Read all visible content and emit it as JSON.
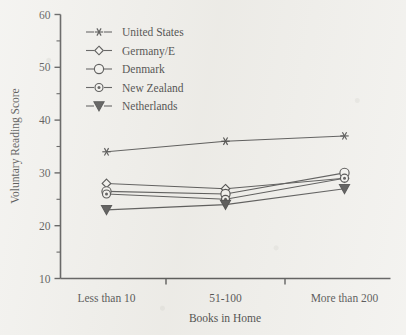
{
  "chart_data": {
    "type": "line",
    "title": "",
    "xlabel": "Books in Home",
    "ylabel": "Voluntary Reading Score",
    "categories": [
      "Less than 10",
      "51-100",
      "More than 200"
    ],
    "ylim": [
      10,
      60
    ],
    "y_ticks": [
      10,
      20,
      30,
      40,
      50,
      60
    ],
    "y_minor_ticks": [
      15,
      25,
      35,
      45,
      55
    ],
    "grid": false,
    "legend_position": "top-left inside plot",
    "series": [
      {
        "name": "United States",
        "marker": "asterisk",
        "values": [
          34,
          36,
          37
        ]
      },
      {
        "name": "Germany/E",
        "marker": "open-diamond",
        "values": [
          28,
          27,
          29
        ]
      },
      {
        "name": "Denmark",
        "marker": "open-circle",
        "values": [
          26.5,
          26,
          30
        ]
      },
      {
        "name": "New Zealand",
        "marker": "dotted-circle",
        "values": [
          26,
          25,
          29
        ]
      },
      {
        "name": "Netherlands",
        "marker": "filled-triangle-down",
        "values": [
          23,
          24,
          27
        ]
      }
    ]
  },
  "axis": {
    "y_tick_labels": [
      "60",
      "50",
      "40",
      "30",
      "20",
      "10"
    ],
    "x_tick_labels": [
      "Less than 10",
      "51-100",
      "More than 200"
    ],
    "y_title": "Voluntary Reading Score",
    "x_title": "Books in Home"
  },
  "legend": {
    "entries": [
      {
        "label": "United States"
      },
      {
        "label": "Germany/E"
      },
      {
        "label": "Denmark"
      },
      {
        "label": "New Zealand"
      },
      {
        "label": "Netherlands"
      }
    ]
  },
  "colors": {
    "ink": "#1f1f1f",
    "paper": "#efeeea",
    "line": "#2b2b2b"
  }
}
